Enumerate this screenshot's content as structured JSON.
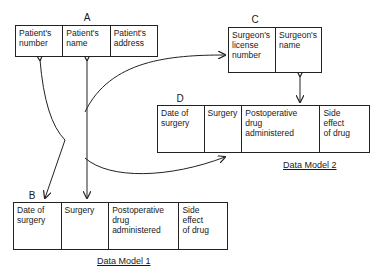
{
  "entities": {
    "A": {
      "label": "A",
      "cells": [
        "Patient's\nnumber",
        "Patient's\nname",
        "Patient's\naddress"
      ]
    },
    "C": {
      "label": "C",
      "cells": [
        "Surgeon's\nlicense\nnumber",
        "Surgeon's\nname"
      ]
    },
    "D": {
      "label": "D",
      "cells": [
        "Date of\nsurgery",
        "Surgery",
        "Postoperative\ndrug\nadministered",
        "Side\neffect\nof drug"
      ]
    },
    "B": {
      "label": "B",
      "cells": [
        "Date of\nsurgery",
        "Surgery",
        "Postoperative\ndrug\nadministered",
        "Side\neffect\nof drug"
      ]
    }
  },
  "captions": {
    "model1": "Data Model 1",
    "model2": "Data Model 2"
  }
}
